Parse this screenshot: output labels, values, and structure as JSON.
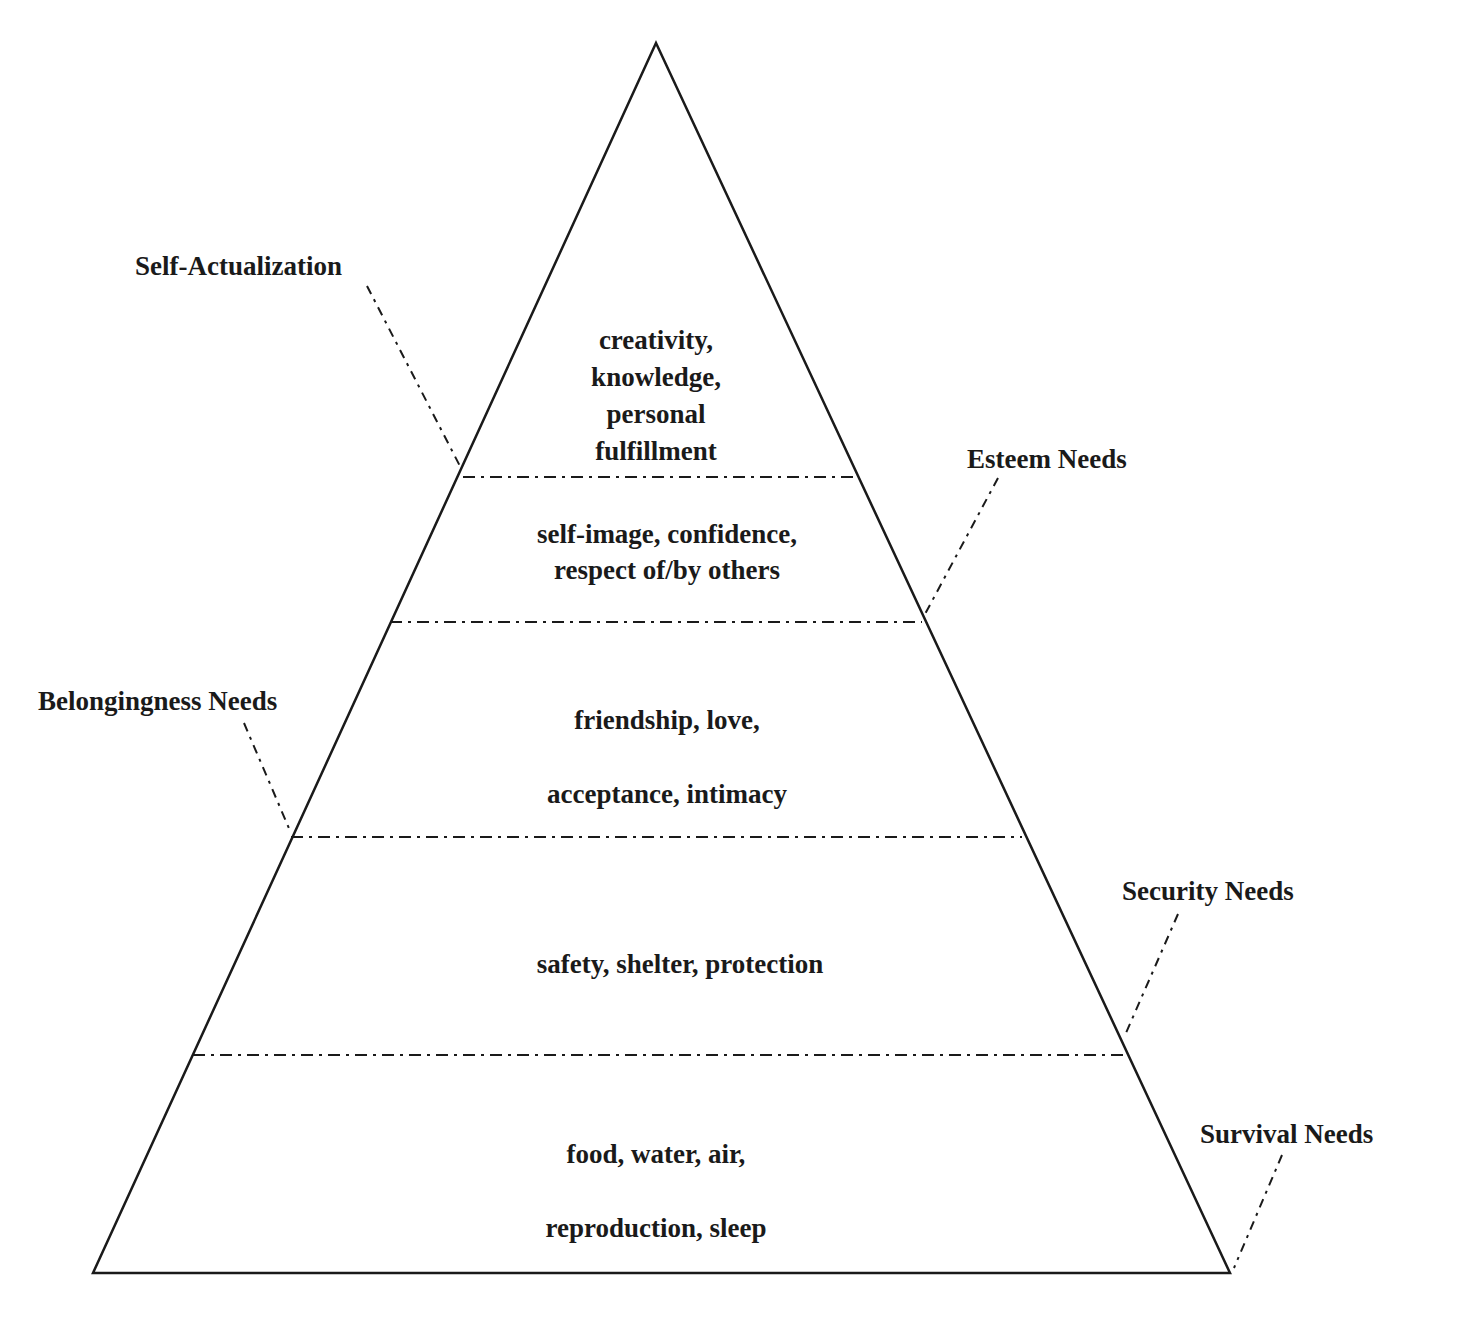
{
  "diagram": {
    "type": "hierarchy-pyramid",
    "stroke_color": "#1a1a1a",
    "background": "#ffffff",
    "levels": [
      {
        "name": "Self-Actualization",
        "label_side": "left",
        "lines": [
          "creativity,",
          "knowledge,",
          "personal",
          "fulfillment"
        ]
      },
      {
        "name": "Esteem Needs",
        "label_side": "right",
        "lines": [
          "self-image, confidence,",
          "respect of/by others"
        ]
      },
      {
        "name": "Belongingness Needs",
        "label_side": "left",
        "lines": [
          "friendship, love,",
          "acceptance, intimacy"
        ]
      },
      {
        "name": "Security Needs",
        "label_side": "right",
        "lines": [
          "safety, shelter, protection"
        ]
      },
      {
        "name": "Survival Needs",
        "label_side": "right",
        "lines": [
          "food, water, air,",
          "reproduction, sleep"
        ]
      }
    ]
  }
}
